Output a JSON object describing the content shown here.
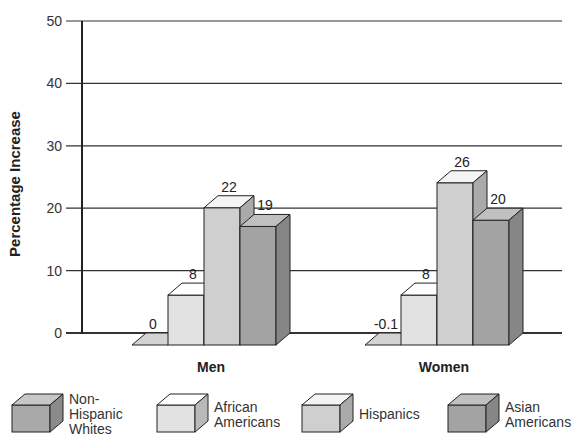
{
  "chart_data": {
    "type": "bar",
    "title": "",
    "xlabel": "",
    "ylabel": "Percentage Increase",
    "ylim": [
      0,
      50
    ],
    "yticks": [
      0,
      10,
      20,
      30,
      40,
      50
    ],
    "grid": true,
    "legend_position": "bottom",
    "style": "3d-clustered-bar",
    "categories": [
      "Men",
      "Women"
    ],
    "series": [
      {
        "name": "Non-Hispanic Whites",
        "legend_lines": [
          "Non-",
          "Hispanic",
          "Whites"
        ],
        "color": "#a9a9a9",
        "values": [
          0,
          -0.1
        ],
        "labels": [
          "0",
          "-0.1"
        ]
      },
      {
        "name": "African Americans",
        "legend_lines": [
          "African",
          "Americans"
        ],
        "color": "#e2e2e2",
        "values": [
          8,
          8
        ],
        "labels": [
          "8",
          "8"
        ]
      },
      {
        "name": "Hispanics",
        "legend_lines": [
          "Hispanics"
        ],
        "color": "#cfcfcf",
        "values": [
          22,
          26
        ],
        "labels": [
          "22",
          "26"
        ]
      },
      {
        "name": "Asian Americans",
        "legend_lines": [
          "Asian",
          "Americans"
        ],
        "color": "#a3a3a3",
        "values": [
          19,
          20
        ],
        "labels": [
          "19",
          "20"
        ]
      }
    ]
  }
}
